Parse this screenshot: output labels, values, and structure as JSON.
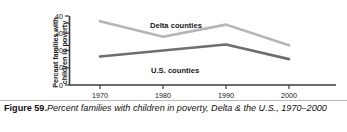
{
  "figure": {
    "number_label": "Figure 59.",
    "caption_text": "Percent families with children in poverty, Delta & the U.S., 1970–2000"
  },
  "axis": {
    "y_title_line1": "Percent families with",
    "y_title_line2": "children in poverty",
    "y_ticks": [
      "0",
      "10",
      "20",
      "30",
      "40"
    ],
    "x_ticks": [
      "1970",
      "1980",
      "1990",
      "2000"
    ]
  },
  "series_labels": {
    "delta": "Delta counties",
    "us": "U.S. counties"
  },
  "colors": {
    "delta_line": "#b5b5b5",
    "us_line": "#6e6e6e",
    "axis": "#3b3b3b",
    "rule": "#b9b9b9",
    "text": "#1a1a1a"
  },
  "chart_data": {
    "type": "line",
    "title": "Percent families with children in poverty, Delta & the U.S., 1970–2000",
    "xlabel": "",
    "ylabel": "Percent families with children in poverty",
    "x": [
      1970,
      1980,
      1990,
      2000
    ],
    "categories": [
      "1970",
      "1980",
      "1990",
      "2000"
    ],
    "series": [
      {
        "name": "Delta counties",
        "values": [
          37,
          28,
          35,
          23
        ],
        "color": "#b5b5b5"
      },
      {
        "name": "U.S. counties",
        "values": [
          16.5,
          20,
          23.5,
          15
        ],
        "color": "#6e6e6e"
      }
    ],
    "ylim": [
      0,
      40
    ],
    "yticks": [
      0,
      10,
      20,
      30,
      40
    ],
    "xlim": [
      1965,
      2005
    ],
    "grid": false,
    "legend": "inline-annotations"
  }
}
